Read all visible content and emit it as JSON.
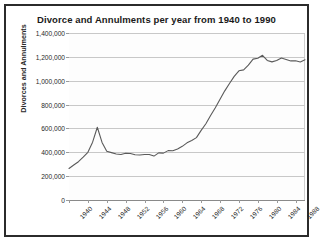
{
  "chart_data": {
    "type": "line",
    "title": "Divorce and Annulments per year from 1940 to 1990",
    "xlabel": "",
    "ylabel": "Divorces and Annulments",
    "xlim": [
      1940,
      1990
    ],
    "ylim": [
      0,
      1400000
    ],
    "grid": true,
    "legend": false,
    "legend_position": "none",
    "line_color": "#5a5a5a",
    "plot_background": "#fdfdfd",
    "grid_color": "#c8c8c8",
    "frame_color": "#2b2b2b",
    "ytick_labels": [
      "1,400,000",
      "1,200,000",
      "1,000,000",
      "800,000",
      "600,000",
      "400,000",
      "200,000",
      "0"
    ],
    "ytick_values": [
      1400000,
      1200000,
      1000000,
      800000,
      600000,
      400000,
      200000,
      0
    ],
    "xtick_labels": [
      "1940",
      "1944",
      "1948",
      "1952",
      "1956",
      "1960",
      "1964",
      "1968",
      "1972",
      "1976",
      "1980",
      "1984",
      "1988"
    ],
    "xtick_values": [
      1940,
      1944,
      1948,
      1952,
      1956,
      1960,
      1964,
      1968,
      1972,
      1976,
      1980,
      1984,
      1988
    ],
    "series": [
      {
        "name": "Divorces and Annulments",
        "x": [
          1940,
          1941,
          1942,
          1943,
          1944,
          1945,
          1946,
          1947,
          1948,
          1949,
          1950,
          1951,
          1952,
          1953,
          1954,
          1955,
          1956,
          1957,
          1958,
          1959,
          1960,
          1961,
          1962,
          1963,
          1964,
          1965,
          1966,
          1967,
          1968,
          1969,
          1970,
          1971,
          1972,
          1973,
          1974,
          1975,
          1976,
          1977,
          1978,
          1979,
          1980,
          1981,
          1982,
          1983,
          1984,
          1985,
          1986,
          1987,
          1988,
          1989,
          1990
        ],
        "values": [
          264000,
          293000,
          321000,
          359000,
          400000,
          485000,
          610000,
          483000,
          408000,
          397000,
          385000,
          381000,
          392000,
          390000,
          379000,
          377000,
          382000,
          381000,
          368000,
          395000,
          393000,
          414000,
          413000,
          428000,
          450000,
          479000,
          499000,
          523000,
          584000,
          639000,
          708000,
          773000,
          845000,
          915000,
          977000,
          1036000,
          1083000,
          1091000,
          1130000,
          1181000,
          1189000,
          1213000,
          1170000,
          1158000,
          1169000,
          1190000,
          1178000,
          1166000,
          1167000,
          1157000,
          1175000
        ]
      }
    ]
  }
}
